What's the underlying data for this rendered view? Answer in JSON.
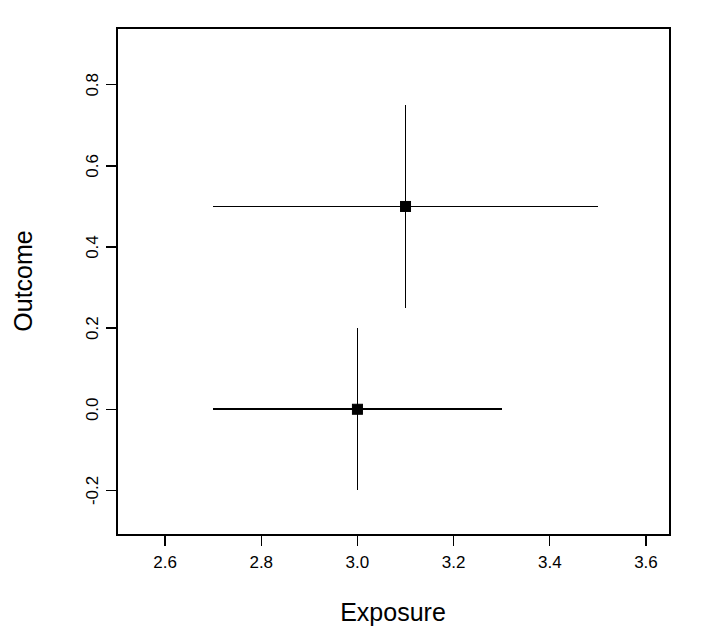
{
  "chart_data": {
    "type": "scatter",
    "title": "",
    "xlabel": "Exposure",
    "ylabel": "Outcome",
    "xlim": [
      2.5,
      3.65
    ],
    "ylim": [
      -0.31,
      0.94
    ],
    "grid": false,
    "legend": null,
    "xticks": [
      "2.6",
      "2.8",
      "3.0",
      "3.2",
      "3.4",
      "3.6"
    ],
    "xtick_values": [
      2.6,
      2.8,
      3.0,
      3.2,
      3.4,
      3.6
    ],
    "yticks": [
      "-0.2",
      "0.0",
      "0.2",
      "0.4",
      "0.6",
      "0.8"
    ],
    "ytick_values": [
      -0.2,
      0.0,
      0.2,
      0.4,
      0.6,
      0.8
    ],
    "marker": "filled-square",
    "error_bars": "both",
    "points": [
      {
        "label": "point-upper",
        "x": 3.1,
        "y": 0.5,
        "x_low": 2.7,
        "x_high": 3.5,
        "y_low": 0.25,
        "y_high": 0.75
      },
      {
        "label": "point-lower",
        "x": 3.0,
        "y": 0.0,
        "x_low": 2.7,
        "x_high": 3.3,
        "y_low": -0.2,
        "y_high": 0.2
      }
    ],
    "colors": {
      "line": "#000000",
      "marker": "#000000",
      "background": "#ffffff",
      "axis": "#000000"
    }
  }
}
